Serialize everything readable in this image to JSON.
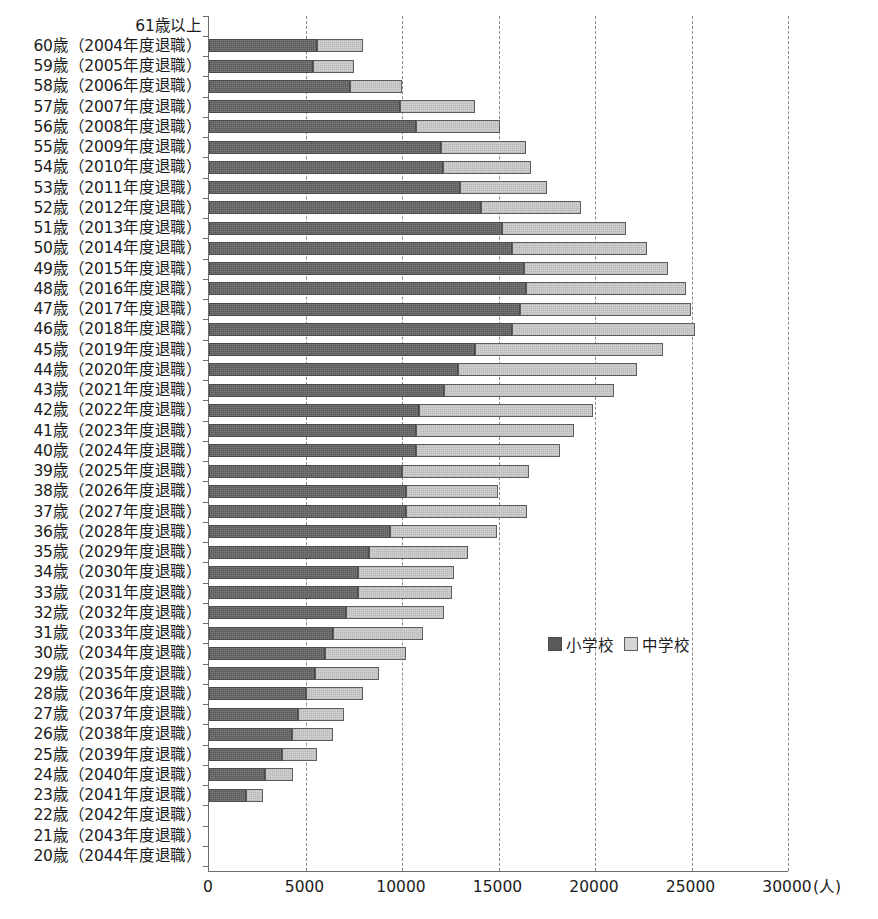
{
  "chart_data": {
    "type": "bar",
    "orientation": "horizontal",
    "stacked": true,
    "title": "",
    "xlabel": "(人)",
    "ylabel": "",
    "xlim": [
      0,
      30000
    ],
    "xticks": [
      0,
      5000,
      10000,
      15000,
      20000,
      25000,
      30000
    ],
    "xtick_labels": [
      "0",
      "5000",
      "10000",
      "15000",
      "20000",
      "25000",
      "30000"
    ],
    "unit_label": "(人)",
    "grid": "vertical dashed gridlines at every x tick",
    "legend_position": "inside right, middle-lower area",
    "categories": [
      "61歳以上",
      "60歳（2004年度退職）",
      "59歳（2005年度退職）",
      "58歳（2006年度退職）",
      "57歳（2007年度退職）",
      "56歳（2008年度退職）",
      "55歳（2009年度退職）",
      "54歳（2010年度退職）",
      "53歳（2011年度退職）",
      "52歳（2012年度退職）",
      "51歳（2013年度退職）",
      "50歳（2014年度退職）",
      "49歳（2015年度退職）",
      "48歳（2016年度退職）",
      "47歳（2017年度退職）",
      "46歳（2018年度退職）",
      "45歳（2019年度退職）",
      "44歳（2020年度退職）",
      "43歳（2021年度退職）",
      "42歳（2022年度退職）",
      "41歳（2023年度退職）",
      "40歳（2024年度退職）",
      "39歳（2025年度退職）",
      "38歳（2026年度退職）",
      "37歳（2027年度退職）",
      "36歳（2028年度退職）",
      "35歳（2029年度退職）",
      "34歳（2030年度退職）",
      "33歳（2031年度退職）",
      "32歳（2032年度退職）",
      "31歳（2033年度退職）",
      "30歳（2034年度退職）",
      "29歳（2035年度退職）",
      "28歳（2036年度退職）",
      "27歳（2037年度退職）",
      "26歳（2038年度退職）",
      "25歳（2039年度退職）",
      "24歳（2040年度退職）",
      "23歳（2041年度退職）",
      "22歳（2042年度退職）",
      "21歳（2043年度退職）",
      "20歳（2044年度退職）"
    ],
    "series": [
      {
        "name": "小学校",
        "color": "#595959",
        "values": [
          0,
          5600,
          5400,
          7300,
          9900,
          10700,
          12000,
          12100,
          13000,
          14100,
          15200,
          15700,
          16300,
          16400,
          16100,
          15700,
          13800,
          12900,
          12200,
          10900,
          10700,
          10700,
          10000,
          10200,
          10200,
          9400,
          8300,
          7700,
          7700,
          7100,
          6400,
          6000,
          5500,
          5000,
          4600,
          4300,
          3800,
          2900,
          1900,
          0,
          0,
          0
        ]
      },
      {
        "name": "中学校",
        "color": "#d4d4d4",
        "values": [
          0,
          2400,
          2100,
          2700,
          3900,
          4400,
          4400,
          4600,
          4500,
          5200,
          6400,
          7000,
          7500,
          8300,
          8900,
          9500,
          9700,
          9300,
          8800,
          9000,
          8200,
          7500,
          6600,
          4800,
          6300,
          5500,
          5100,
          5000,
          4900,
          5100,
          4700,
          4200,
          3300,
          3000,
          2400,
          2100,
          1800,
          1450,
          900,
          0,
          0,
          0
        ]
      }
    ],
    "totals": [
      0,
      8000,
      7500,
      10000,
      13800,
      15100,
      16400,
      16700,
      17500,
      19300,
      21600,
      22700,
      23800,
      24700,
      25000,
      25200,
      23500,
      22200,
      21000,
      19900,
      18900,
      18200,
      16600,
      15000,
      16500,
      14900,
      13400,
      12700,
      12600,
      12200,
      11100,
      10200,
      8800,
      8000,
      7000,
      6400,
      5600,
      4350,
      2800,
      0,
      0,
      0
    ]
  },
  "legend": {
    "items": [
      {
        "label": "小学校",
        "swatch": "dark-swatch"
      },
      {
        "label": "中学校",
        "swatch": "light-swatch"
      }
    ]
  }
}
